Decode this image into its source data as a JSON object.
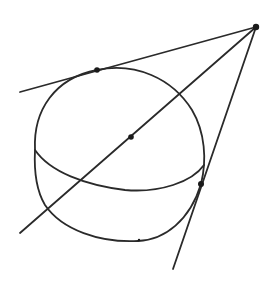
{
  "diagram": {
    "colors": {
      "stroke": "#2a2a2a",
      "point": "#1a1a1a",
      "background": "#ffffff"
    },
    "points": {
      "apex": {
        "x": 256,
        "y": 27
      },
      "center": {
        "x": 131,
        "y": 137
      },
      "tangent_top": {
        "x": 97,
        "y": 70
      },
      "tangent_right": {
        "x": 201,
        "y": 184
      }
    },
    "sphere": {
      "cx": 120,
      "cy": 155,
      "rx": 86,
      "ry": 86
    },
    "lines": [
      {
        "name": "upper-tangent-line",
        "x1": 256,
        "y1": 27,
        "x2": 20,
        "y2": 92
      },
      {
        "name": "center-line",
        "x1": 256,
        "y1": 27,
        "x2": 20,
        "y2": 233
      },
      {
        "name": "lower-tangent-line",
        "x1": 256,
        "y1": 27,
        "x2": 173,
        "y2": 269
      }
    ]
  }
}
